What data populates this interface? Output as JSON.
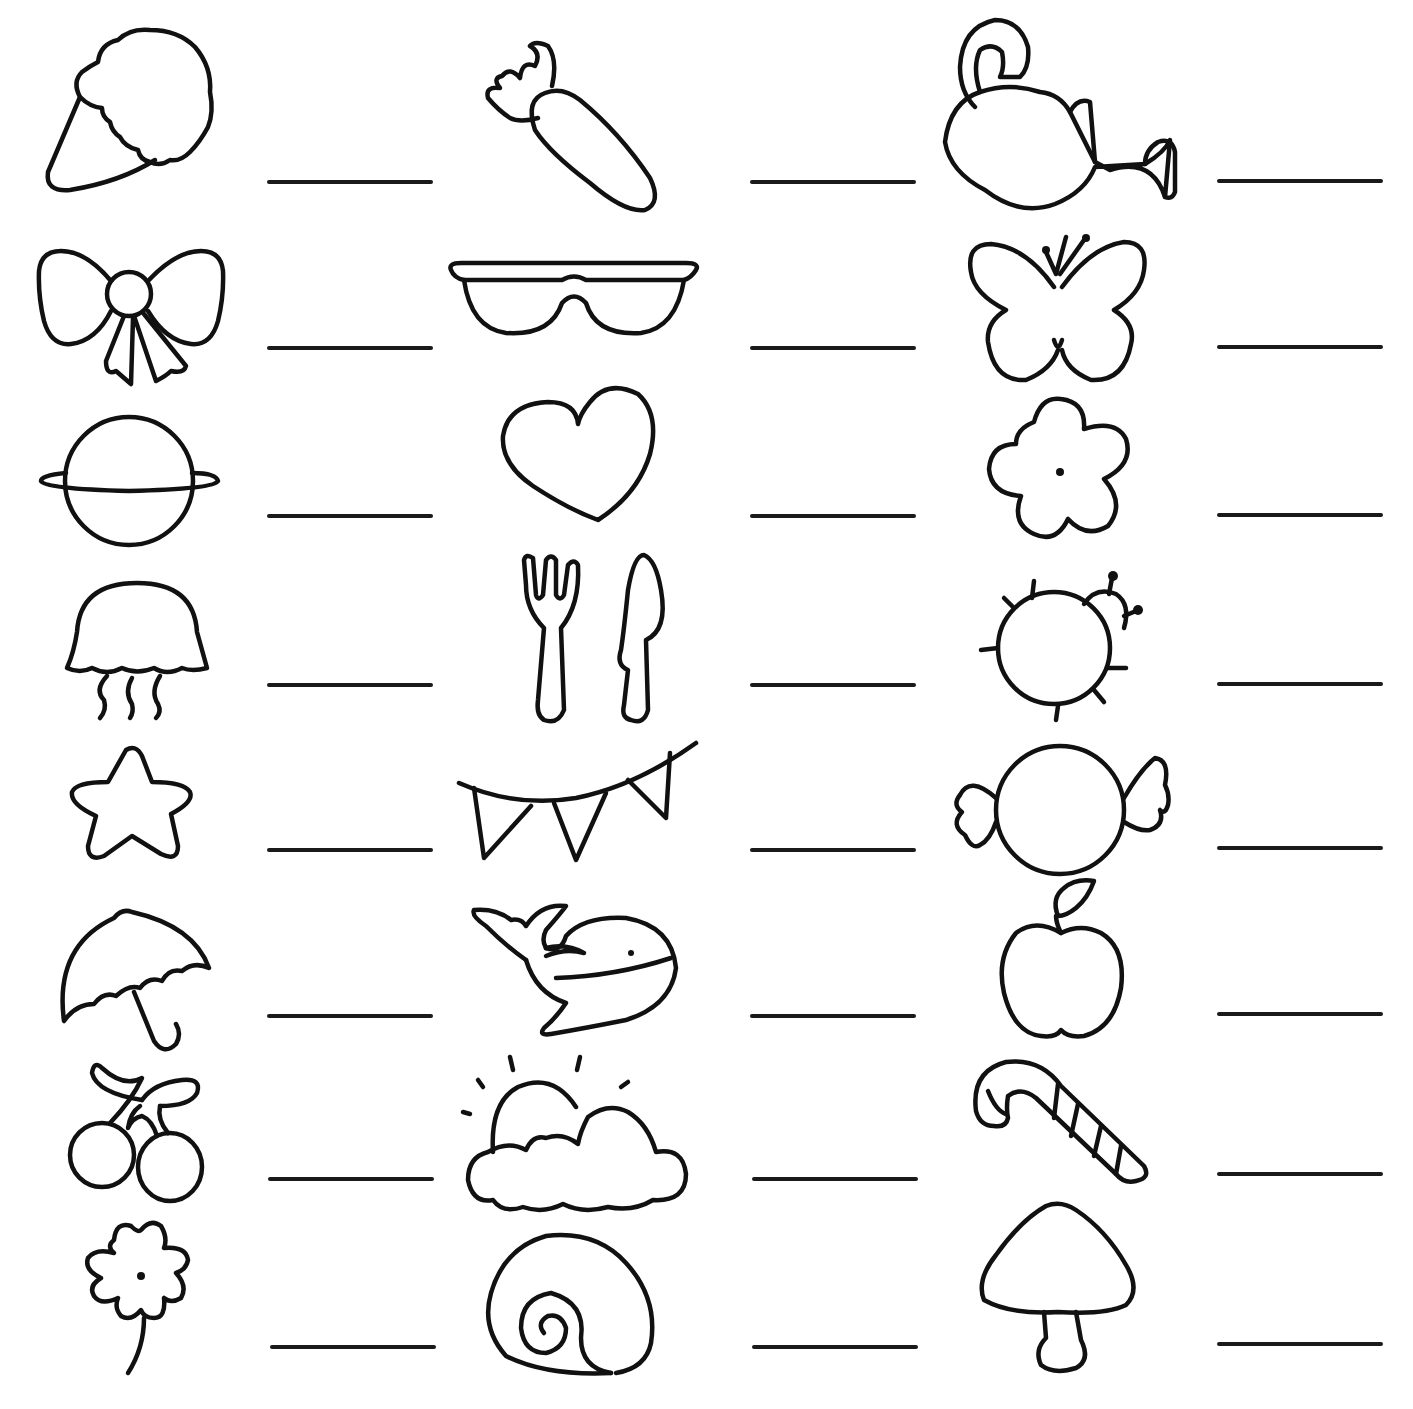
{
  "worksheet": {
    "type": "picture-word labeling worksheet",
    "line_color": "#1a1a1a",
    "background": "#ffffff",
    "columns": [
      {
        "items": [
          {
            "icon": "ice-cream-cone-icon",
            "label": "ice cream",
            "answer": ""
          },
          {
            "icon": "bow-icon",
            "label": "bow",
            "answer": ""
          },
          {
            "icon": "planet-icon",
            "label": "planet",
            "answer": ""
          },
          {
            "icon": "jellyfish-icon",
            "label": "jellyfish",
            "answer": ""
          },
          {
            "icon": "star-icon",
            "label": "star",
            "answer": ""
          },
          {
            "icon": "umbrella-icon",
            "label": "umbrella",
            "answer": ""
          },
          {
            "icon": "cherries-icon",
            "label": "cherries",
            "answer": ""
          },
          {
            "icon": "clover-flower-icon",
            "label": "flower",
            "answer": ""
          }
        ]
      },
      {
        "items": [
          {
            "icon": "carrot-icon",
            "label": "carrot",
            "answer": ""
          },
          {
            "icon": "sunglasses-icon",
            "label": "sunglasses",
            "answer": ""
          },
          {
            "icon": "heart-icon",
            "label": "heart",
            "answer": ""
          },
          {
            "icon": "fork-knife-icon",
            "label": "fork and knife",
            "answer": ""
          },
          {
            "icon": "bunting-icon",
            "label": "bunting",
            "answer": ""
          },
          {
            "icon": "whale-icon",
            "label": "whale",
            "answer": ""
          },
          {
            "icon": "sun-cloud-icon",
            "label": "sun and cloud",
            "answer": ""
          },
          {
            "icon": "shell-icon",
            "label": "shell",
            "answer": ""
          }
        ]
      },
      {
        "items": [
          {
            "icon": "watering-can-icon",
            "label": "watering can",
            "answer": ""
          },
          {
            "icon": "butterfly-icon",
            "label": "butterfly",
            "answer": ""
          },
          {
            "icon": "flower-icon",
            "label": "flower",
            "answer": ""
          },
          {
            "icon": "ladybug-icon",
            "label": "ladybug",
            "answer": ""
          },
          {
            "icon": "candy-icon",
            "label": "candy",
            "answer": ""
          },
          {
            "icon": "apple-icon",
            "label": "apple",
            "answer": ""
          },
          {
            "icon": "candy-cane-icon",
            "label": "candy cane",
            "answer": ""
          },
          {
            "icon": "mushroom-icon",
            "label": "mushroom",
            "answer": ""
          }
        ]
      }
    ]
  }
}
